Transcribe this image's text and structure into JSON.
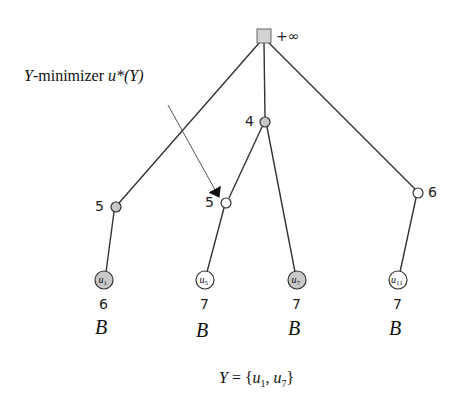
{
  "diagram": {
    "type": "tree",
    "root": {
      "id": "root",
      "shape": "square",
      "value": "+∞",
      "fill": "#d3d3d3",
      "x": 264,
      "y": 36
    },
    "annotation": {
      "label": "Y-minimizer u*(Y)",
      "label_parts": {
        "var": "Y",
        "text": "-minimizer ",
        "expr": "u*(Y)"
      },
      "arrow_from": [
        168,
        105
      ],
      "arrow_to": [
        221,
        199
      ]
    },
    "internal_nodes": [
      {
        "id": "n_left",
        "value": "5",
        "fill": "#c8c8c8",
        "x": 116,
        "y": 207
      },
      {
        "id": "n_mid",
        "value": "4",
        "fill": "#c8c8c8",
        "x": 265,
        "y": 122
      },
      {
        "id": "n_mid_left",
        "value": "5",
        "fill": "#ffffff",
        "x": 226,
        "y": 203
      },
      {
        "id": "n_right",
        "value": "6",
        "fill": "#ffffff",
        "x": 418,
        "y": 193
      }
    ],
    "leaves": [
      {
        "id": "u1",
        "label": "u",
        "subscript": "1",
        "value": "6",
        "tag": "B",
        "fill": "#c8c8c8",
        "x": 104,
        "y": 280
      },
      {
        "id": "u5",
        "label": "u",
        "subscript": "5",
        "value": "7",
        "tag": "B",
        "fill": "#ffffff",
        "x": 205,
        "y": 280
      },
      {
        "id": "u7",
        "label": "u",
        "subscript": "7",
        "value": "7",
        "tag": "B",
        "fill": "#c8c8c8",
        "x": 297,
        "y": 280
      },
      {
        "id": "u11",
        "label": "u",
        "subscript": "11",
        "value": "7",
        "tag": "B",
        "fill": "#ffffff",
        "x": 398,
        "y": 280
      }
    ],
    "edges": [
      [
        "root",
        "n_left"
      ],
      [
        "root",
        "n_mid"
      ],
      [
        "root",
        "n_right"
      ],
      [
        "n_mid",
        "n_mid_left"
      ],
      [
        "n_mid",
        "u7"
      ],
      [
        "n_left",
        "u1"
      ],
      [
        "n_mid_left",
        "u5"
      ],
      [
        "n_right",
        "u11"
      ]
    ],
    "caption": {
      "text": "Y = {u1, u7}",
      "var": "Y",
      "eq": " = {",
      "item1": "u",
      "item1_sub": "1",
      "sep": ", ",
      "item2": "u",
      "item2_sub": "7",
      "close": "}"
    }
  }
}
